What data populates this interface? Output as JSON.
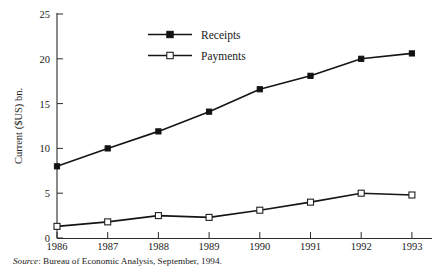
{
  "chart_data": {
    "type": "line",
    "title": "",
    "subtitle": "",
    "xlabel": "",
    "ylabel": "Current ($US) bn.",
    "categories": [
      "1986",
      "1987",
      "1988",
      "1989",
      "1990",
      "1991",
      "1992",
      "1993"
    ],
    "x": [
      1986,
      1987,
      1988,
      1989,
      1990,
      1991,
      1992,
      1993
    ],
    "series": [
      {
        "name": "Receipts",
        "marker": "filled-square",
        "values": [
          8.0,
          10.0,
          11.9,
          14.1,
          16.6,
          18.1,
          20.0,
          20.6
        ]
      },
      {
        "name": "Payments",
        "marker": "open-square",
        "values": [
          1.3,
          1.8,
          2.5,
          2.3,
          3.1,
          4.0,
          5.0,
          4.8
        ]
      }
    ],
    "ylim": [
      0,
      25
    ],
    "yticks": [
      0,
      5,
      10,
      15,
      20,
      25
    ],
    "ytick_labels": [
      "0",
      "5",
      "10",
      "15",
      "20",
      "25"
    ],
    "xtick_labels": [
      "1986",
      "1987",
      "1988",
      "1989",
      "1990",
      "1991",
      "1992",
      "1993"
    ],
    "grid": false,
    "legend_position": "top-center",
    "line_color": "#151515",
    "axis_color": "#2b2b2b"
  },
  "source": {
    "prefix": "Source",
    "separator": ":",
    "text": "Bureau of Economic Analysis, September, 1994.",
    "full": "Source: Bureau of Economic Analysis, September, 1994."
  },
  "legend": {
    "items": [
      {
        "label": "Receipts"
      },
      {
        "label": "Payments"
      }
    ]
  }
}
